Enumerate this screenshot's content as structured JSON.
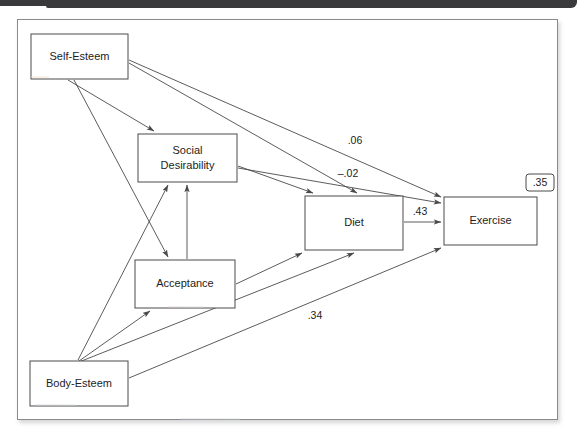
{
  "figure": {
    "type": "path-diagram",
    "nodes": [
      {
        "id": "self_esteem",
        "label": "Self-Esteem",
        "x": 31,
        "y": 34,
        "w": 97,
        "h": 45
      },
      {
        "id": "social_desirability",
        "label": "Social\nDesirability",
        "line1": "Social",
        "line2": "Desirability",
        "x": 138,
        "y": 134,
        "w": 99,
        "h": 48
      },
      {
        "id": "acceptance",
        "label": "Acceptance",
        "x": 135,
        "y": 260,
        "w": 100,
        "h": 48
      },
      {
        "id": "diet",
        "label": "Diet",
        "x": 305,
        "y": 196,
        "w": 98,
        "h": 54
      },
      {
        "id": "exercise",
        "label": "Exercise",
        "x": 444,
        "y": 197,
        "w": 93,
        "h": 48
      },
      {
        "id": "body_esteem",
        "label": "Body-Esteem",
        "x": 30,
        "y": 361,
        "w": 98,
        "h": 45
      }
    ],
    "paths": [
      {
        "from": "self_esteem",
        "to": "social_desirability",
        "label": ""
      },
      {
        "from": "self_esteem",
        "to": "acceptance",
        "label": ""
      },
      {
        "from": "self_esteem",
        "to": "diet",
        "label": ""
      },
      {
        "from": "self_esteem",
        "to": "exercise",
        "label": ".06"
      },
      {
        "from": "social_desirability",
        "to": "diet",
        "label": ""
      },
      {
        "from": "social_desirability",
        "to": "exercise",
        "label": "–.02"
      },
      {
        "from": "acceptance",
        "to": "social_desirability",
        "label": ""
      },
      {
        "from": "acceptance",
        "to": "diet",
        "label": ""
      },
      {
        "from": "diet",
        "to": "exercise",
        "label": ".43"
      },
      {
        "from": "body_esteem",
        "to": "social_desirability",
        "label": ""
      },
      {
        "from": "body_esteem",
        "to": "acceptance",
        "label": ""
      },
      {
        "from": "body_esteem",
        "to": "diet",
        "label": ""
      },
      {
        "from": "body_esteem",
        "to": "exercise",
        "label": ".34"
      }
    ],
    "coefficients": {
      "self_esteem_to_exercise": ".06",
      "social_desirability_to_exercise": "–.02",
      "diet_to_exercise": ".43",
      "body_esteem_to_exercise": ".34"
    },
    "variance_explained": {
      "exercise": ".35"
    },
    "colors": {
      "line": "#4a4a4a",
      "text": "#1d1d1d",
      "box_fill": "#ffffff",
      "page_background": "#ffffff",
      "scan_bar": "#3a3a3c"
    }
  }
}
